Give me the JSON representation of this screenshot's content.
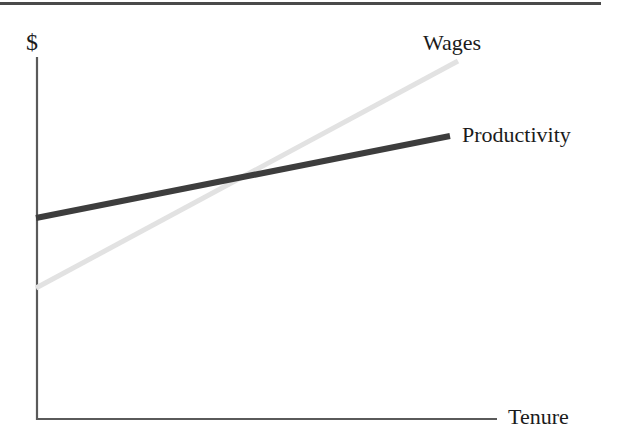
{
  "figure": {
    "top_rule": true,
    "background_color": "#ffffff"
  },
  "chart_data": {
    "type": "line",
    "title": "",
    "subtitle": "",
    "xlabel": "Tenure",
    "ylabel": "$",
    "xlim": [
      0,
      1
    ],
    "ylim": [
      0,
      1
    ],
    "grid": false,
    "axis_ticks": false,
    "legend": "inline-end-of-line",
    "annotations": [],
    "series": [
      {
        "name": "Wages",
        "color": "#e2e2e2",
        "linewidth": 5,
        "x": [
          0,
          1
        ],
        "values": [
          0.365,
          1.0
        ],
        "points_px": [
          [
            36,
            288
          ],
          [
            458,
            61
          ]
        ],
        "label_position": "above-end"
      },
      {
        "name": "Productivity",
        "color": "#3d3d3d",
        "linewidth": 6,
        "x": [
          0,
          1
        ],
        "values": [
          0.56,
          0.785
        ],
        "points_px": [
          [
            36,
            218
          ],
          [
            450,
            136
          ]
        ],
        "label_position": "end"
      }
    ],
    "intersection_px": [
      250,
      177
    ],
    "axes_px": {
      "origin": [
        36,
        420
      ],
      "y_top": 57,
      "x_right": 497
    }
  }
}
